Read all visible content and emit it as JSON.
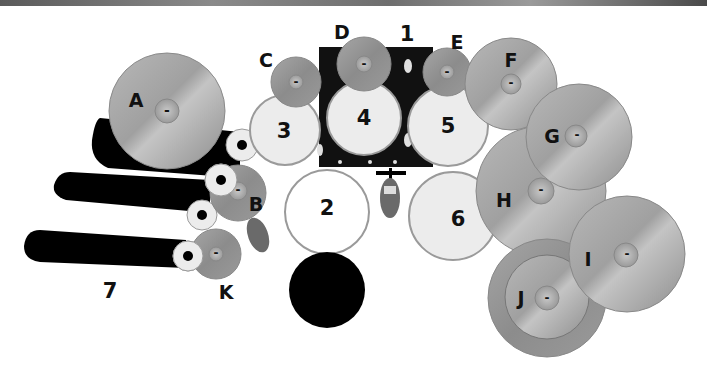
{
  "diagram": {
    "drums": [
      {
        "id": "1",
        "label": "1",
        "name": "bass drum"
      },
      {
        "id": "2",
        "label": "2",
        "name": "snare drum"
      },
      {
        "id": "3",
        "label": "3",
        "name": "tom 3"
      },
      {
        "id": "4",
        "label": "4",
        "name": "tom 4"
      },
      {
        "id": "5",
        "label": "5",
        "name": "tom 5"
      },
      {
        "id": "6",
        "label": "6",
        "name": "floor tom"
      },
      {
        "id": "7",
        "label": "7",
        "name": "tube toms"
      }
    ],
    "cymbals": [
      {
        "id": "A",
        "label": "A",
        "bell": "-"
      },
      {
        "id": "B",
        "label": "B",
        "bell": "-"
      },
      {
        "id": "C",
        "label": "C",
        "bell": "-"
      },
      {
        "id": "D",
        "label": "D",
        "bell": "-"
      },
      {
        "id": "E",
        "label": "E",
        "bell": "-"
      },
      {
        "id": "F",
        "label": "F",
        "bell": "-"
      },
      {
        "id": "G",
        "label": "G",
        "bell": "-"
      },
      {
        "id": "H",
        "label": "H",
        "bell": "-"
      },
      {
        "id": "I",
        "label": "I",
        "bell": "-"
      },
      {
        "id": "J",
        "label": "J",
        "bell": "-"
      },
      {
        "id": "K",
        "label": "K",
        "bell": "-"
      }
    ],
    "colors": {
      "cymbal": "#a8a8a8",
      "cymbal_edge": "#8c8c8c",
      "drum_head": "#ececec",
      "snare_head": "#ffffff",
      "rim": "#9a9a9a",
      "bass_drum": "#111111",
      "throne": "#000000",
      "pedal": "#6a6a6a",
      "text": "#111111"
    }
  }
}
